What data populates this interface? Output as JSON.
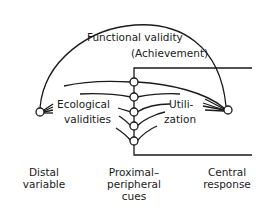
{
  "diagram": {
    "type": "lens-model",
    "arc_label": {
      "line1": "Functional validity",
      "line2": "(Achievement)"
    },
    "left_label": {
      "line1": "Ecological",
      "line2": "validities"
    },
    "right_label": {
      "line1": "Utili-",
      "line2": "zation"
    },
    "bottom_labels": {
      "distal": {
        "line1": "Distal",
        "line2": "variable"
      },
      "cues": {
        "line1": "Proximal–",
        "line2": "peripheral",
        "line3": "cues"
      },
      "response": {
        "line1": "Central",
        "line2": "response"
      }
    },
    "nodes": {
      "distal": {
        "x": 40,
        "y": 112
      },
      "response": {
        "x": 228,
        "y": 110
      },
      "cues": [
        {
          "x": 134,
          "y": 82
        },
        {
          "x": 134,
          "y": 97
        },
        {
          "x": 134,
          "y": 112
        },
        {
          "x": 134,
          "y": 126
        },
        {
          "x": 134,
          "y": 141
        }
      ]
    },
    "cue_count": 5,
    "color": "#1a1a1a"
  }
}
